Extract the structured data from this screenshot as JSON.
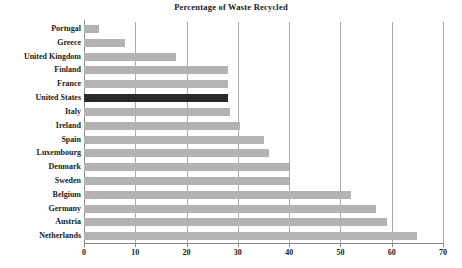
{
  "chart_data": {
    "type": "bar",
    "orientation": "horizontal",
    "title": "Percentage of Waste Recycled",
    "xlabel": "",
    "ylabel": "",
    "xlim": [
      0,
      70
    ],
    "xticks": [
      0,
      10,
      20,
      30,
      40,
      50,
      60,
      70
    ],
    "grid": true,
    "legend": "none",
    "highlight_category": "United States",
    "colors": {
      "bar": "#b3b3b3",
      "highlight_bar": "#282828",
      "grid": "#a9a9a9",
      "axis": "#8a8a8a",
      "text": "#1a1a1a",
      "background": "#ffffff"
    },
    "categories": [
      "Portugal",
      "Greece",
      "United Kingdom",
      "Finland",
      "France",
      "United States",
      "Italy",
      "Ireland",
      "Spain",
      "Luxembourg",
      "Denmark",
      "Sweden",
      "Belgium",
      "Germany",
      "Austria",
      "Netherlands"
    ],
    "values": [
      3,
      8,
      18,
      28,
      28,
      28,
      28.5,
      30.5,
      35,
      36,
      40,
      40,
      52,
      57,
      59,
      65
    ]
  }
}
